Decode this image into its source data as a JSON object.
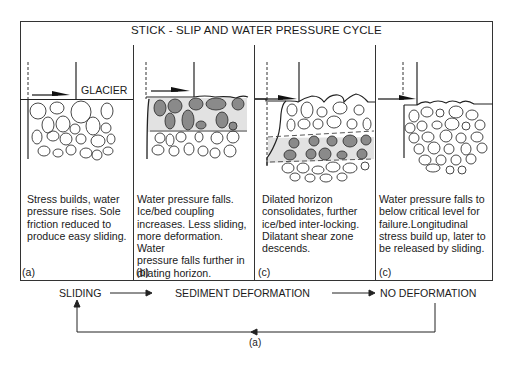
{
  "diagram": {
    "title": "STICK - SLIP AND WATER PRESSURE CYCLE",
    "glacier_label": "GLACIER",
    "panels": [
      {
        "id": "a",
        "description": "Stress builds, water pressure rises. Sole friction reduced to produce easy sliding.",
        "label": "(a)",
        "lines": [
          "Stress builds, water",
          "pressure rises. Sole",
          "friction reduced to",
          "produce easy sliding."
        ]
      },
      {
        "id": "b",
        "description": "Water pressure falls. Ice/bed coupling increases. Less sliding, more deformation. Water pressure falls further in dilating horizon.",
        "label": "(b)",
        "lines": [
          "Water pressure falls.",
          "Ice/bed coupling",
          "increases. Less sliding,",
          "more deformation. Water",
          "pressure falls further in",
          "dilating horizon."
        ]
      },
      {
        "id": "c1",
        "description": "Dilated horizon consolidates, further ice/bed inter-locking. Dilatant shear zone descends.",
        "label": "(c)",
        "lines": [
          "Dilated horizon",
          "consolidates, further",
          "ice/bed inter-locking.",
          "Dilatant shear zone",
          "descends."
        ]
      },
      {
        "id": "c2",
        "description": "Water pressure falls to below critical level for failure.Longitudinal stress build up, later to be released by sliding.",
        "label": "(c)",
        "lines": [
          "Water pressure falls to",
          "below critical level for",
          "failure.Longitudinal",
          "stress build up, later to",
          "be released by sliding."
        ]
      }
    ],
    "flow": {
      "stages": [
        "SLIDING",
        "SEDIMENT DEFORMATION",
        "NO DEFORMATION"
      ],
      "loop_label": "(a)"
    },
    "colors": {
      "line": "#1a1a1a",
      "clast_dark": "#8a8a8a",
      "shear_zone": "#e2e2e2",
      "background": "#ffffff"
    }
  }
}
